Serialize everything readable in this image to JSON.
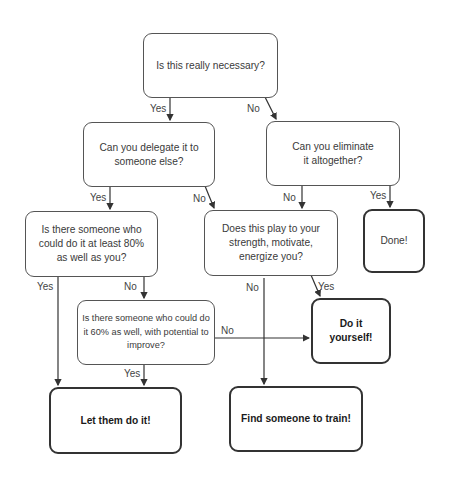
{
  "diagram": {
    "type": "flowchart",
    "nodes": {
      "n1": "Is this really necessary?",
      "n2": "Can you delegate it to someone else?",
      "n3": "Can you eliminate it altogether?",
      "n4": "Is there someone who could do it at least 80% as well as you?",
      "n5": "Does this play to your strength, motivate, energize you?",
      "n6": "Done!",
      "n7": "Is there someone who could do it 60% as well, with potential to improve?",
      "n8": "Do it yourself!",
      "n9": "Let them do it!",
      "n10": "Find someone to train!"
    },
    "edge_labels": {
      "n1_n2": "Yes",
      "n1_n3": "No",
      "n2_n4": "Yes",
      "n2_n5": "No",
      "n3_n5": "No",
      "n3_n6": "Yes",
      "n4_n9": "Yes",
      "n4_n7": "No",
      "n5_n10": "No",
      "n5_n8": "Yes",
      "n7_n8": "No",
      "n7_n9": "Yes"
    }
  }
}
